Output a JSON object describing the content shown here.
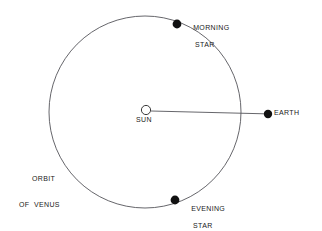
{
  "diagram": {
    "background_color": "#ffffff",
    "stroke_color": "#55555a",
    "marker_color": "#111111",
    "text_color": "#1a1a1a",
    "bodies": {
      "sun": {
        "label": "SUN",
        "marker": "open-circle",
        "cx": 146,
        "cy": 110,
        "r": 5
      },
      "earth": {
        "label": "EARTH",
        "marker": "filled-circle",
        "cx": 268,
        "cy": 114,
        "r": 4.2
      },
      "morning_star": {
        "label_line1": "MORNING",
        "label_line2": "STAR",
        "marker": "filled-circle",
        "cx": 177,
        "cy": 24,
        "r": 4.4
      },
      "evening_star": {
        "label_line1": "EVENING",
        "label_line2": "STAR",
        "marker": "filled-circle",
        "cx": 175,
        "cy": 200,
        "r": 4.4
      }
    },
    "orbit": {
      "label_line1": "ORBIT",
      "label_line2": "OF  VENUS",
      "cx": 145,
      "cy": 112,
      "r": 96
    },
    "sight_line": {
      "name": "sun-earth-line",
      "x1": 150,
      "y1": 111,
      "x2": 265,
      "y2": 114
    }
  }
}
